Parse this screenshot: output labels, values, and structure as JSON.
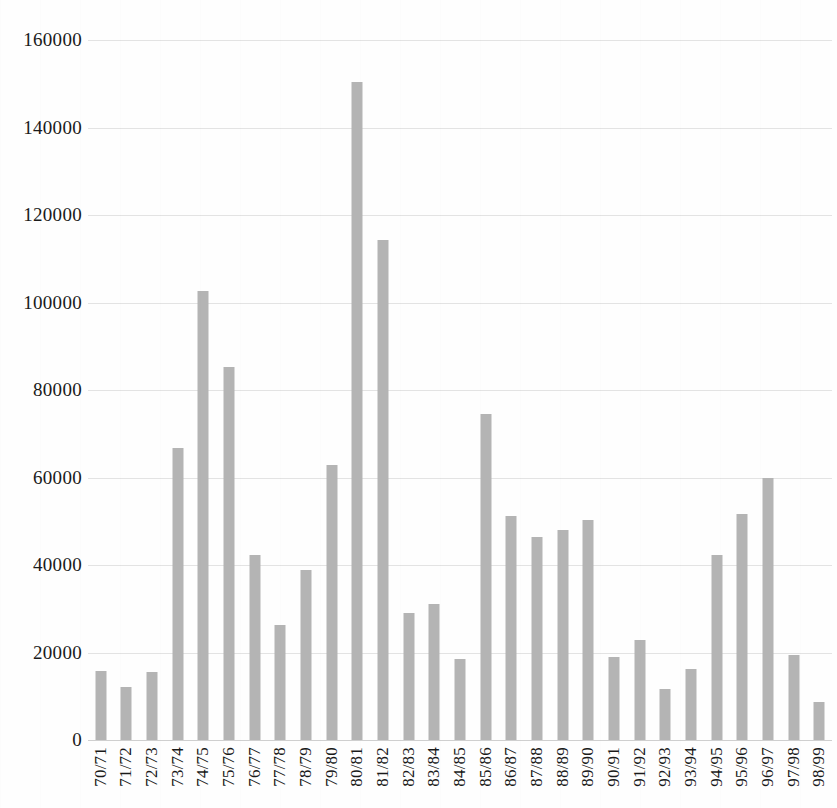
{
  "chart_data": {
    "type": "bar",
    "title": "",
    "subtitle": "",
    "xlabel": "",
    "ylabel": "",
    "ylim": [
      0,
      160000
    ],
    "ytick_step": 20000,
    "grid": true,
    "legend": "none",
    "bar_color": "#b4b4b4",
    "ytick_labels": [
      "160000",
      "140000",
      "120000",
      "100000",
      "80000",
      "60000",
      "40000",
      "20000",
      "0"
    ],
    "ytick_values": [
      160000,
      140000,
      120000,
      100000,
      80000,
      60000,
      40000,
      20000,
      0
    ],
    "categories": [
      "70/71",
      "71/72",
      "72/73",
      "73/74",
      "74/75",
      "75/76",
      "76/77",
      "77/78",
      "78/79",
      "79/80",
      "80/81",
      "81/82",
      "82/83",
      "83/84",
      "84/85",
      "85/86",
      "86/87",
      "87/88",
      "88/89",
      "89/90",
      "90/91",
      "91/92",
      "92/93",
      "93/94",
      "94/95",
      "95/96",
      "96/97",
      "97/98",
      "98/99"
    ],
    "values": [
      15800,
      12200,
      15600,
      66800,
      102700,
      85200,
      42400,
      26200,
      38800,
      62900,
      150400,
      114300,
      29000,
      31100,
      18500,
      74500,
      51300,
      46400,
      48100,
      50200,
      19000,
      22800,
      11600,
      16200,
      42400,
      51700,
      59800,
      19400,
      8700
    ]
  }
}
